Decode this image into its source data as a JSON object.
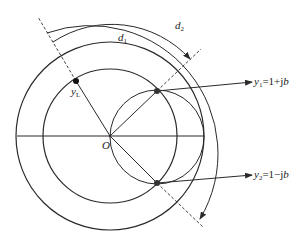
{
  "diagram": {
    "title": "",
    "origin_label": "O",
    "point_load": {
      "var": "y",
      "sub": "L"
    },
    "point_1": {
      "var": "y",
      "sub": "1",
      "expr": "=1+j",
      "b": "b"
    },
    "point_2": {
      "var": "y",
      "sub": "2",
      "expr": "=1−j",
      "b": "b"
    },
    "arc_1": {
      "var": "d",
      "sub": "1"
    },
    "arc_2": {
      "var": "d",
      "sub": "2"
    },
    "colors": {
      "line": "#2a2a2a",
      "background": "#ffffff"
    }
  }
}
